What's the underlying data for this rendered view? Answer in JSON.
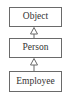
{
  "diagram": {
    "type": "uml-class-inheritance",
    "classes": [
      {
        "name": "Object"
      },
      {
        "name": "Person"
      },
      {
        "name": "Employee"
      }
    ],
    "relationships": [
      {
        "from": "Person",
        "to": "Object",
        "kind": "generalization",
        "arrow": "hollow-triangle-icon"
      },
      {
        "from": "Employee",
        "to": "Person",
        "kind": "generalization",
        "arrow": "hollow-triangle-icon"
      }
    ],
    "colors": {
      "border": "#6a6a6a",
      "text": "#333333",
      "background": "#ffffff"
    }
  }
}
